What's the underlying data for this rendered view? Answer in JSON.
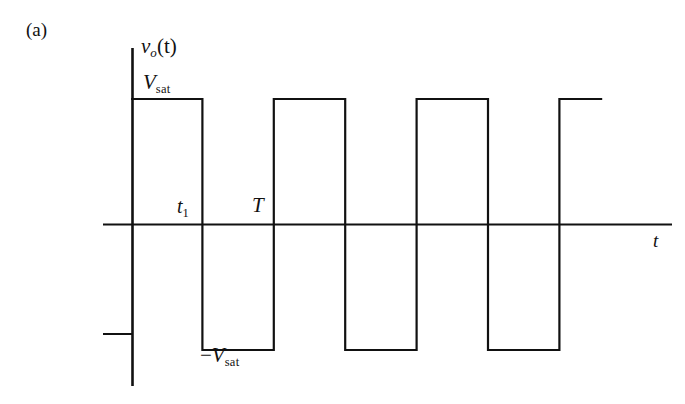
{
  "figure": {
    "panel_tag": "(a)",
    "line_color": "#111111",
    "background_color": "#ffffff"
  },
  "labels": {
    "y_axis_signal": "v",
    "y_axis_signal_sub": "o",
    "y_axis_signal_arg": "(t)",
    "vsat_positive": "V",
    "vsat_positive_sub": "sat",
    "vsat_negative_minus": "−",
    "vsat_negative": "V",
    "vsat_negative_sub": "sat",
    "t1": "t",
    "t1_sub": "1",
    "period": "T",
    "x_axis": "t"
  },
  "chart_data": {
    "type": "line",
    "title": "",
    "xlabel": "t",
    "ylabel": "v_o(t)",
    "grid": false,
    "legend": null,
    "xlim": [
      0,
      7.5
    ],
    "ylim": [
      -1.55,
      1.55
    ],
    "y_levels": {
      "positive_saturation": 1,
      "zero": 0,
      "negative_saturation": -1
    },
    "annotations": [
      {
        "text": "V_sat",
        "x": 0.25,
        "y": 1.0,
        "role": "positive-saturation-level"
      },
      {
        "text": "-V_sat",
        "x": 1.3,
        "y": -1.0,
        "role": "negative-saturation-level"
      },
      {
        "text": "t_1",
        "x": 0.95,
        "y": 0.12,
        "role": "first-transition-time"
      },
      {
        "text": "T",
        "x": 1.95,
        "y": 0.12,
        "role": "period-marker"
      },
      {
        "text": "t",
        "x": 7.4,
        "y": -0.1,
        "role": "time-axis-label"
      }
    ],
    "x_transitions": [
      0,
      1,
      2,
      3,
      4,
      5,
      6
    ],
    "waveform_points": [
      {
        "x": 0,
        "y": 1
      },
      {
        "x": 1,
        "y": 1
      },
      {
        "x": 1,
        "y": -1
      },
      {
        "x": 2,
        "y": -1
      },
      {
        "x": 2,
        "y": 1
      },
      {
        "x": 3,
        "y": 1
      },
      {
        "x": 3,
        "y": -1
      },
      {
        "x": 4,
        "y": -1
      },
      {
        "x": 4,
        "y": 1
      },
      {
        "x": 5,
        "y": 1
      },
      {
        "x": 5,
        "y": -1
      },
      {
        "x": 6,
        "y": -1
      },
      {
        "x": 6,
        "y": 1
      },
      {
        "x": 6.6,
        "y": 1
      }
    ],
    "duty_cycle_percent": 50,
    "period_value": 2,
    "pulse_width": 1
  }
}
